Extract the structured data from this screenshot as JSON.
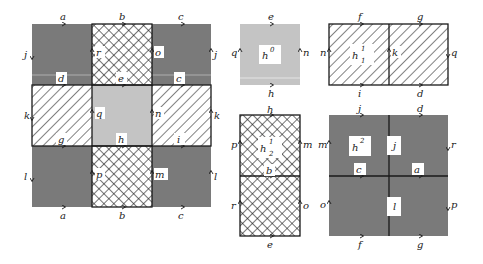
{
  "colors": {
    "dark_gray": "#7a7a7a",
    "light_gray": "#c4c4c4",
    "hatch_bg": "#ffffff",
    "stroke": "#1a1a1a",
    "label_box": "#ffffff"
  },
  "main_complex": {
    "top_edge_labels": [
      "a",
      "b",
      "c"
    ],
    "bottom_edge_labels": [
      "a",
      "b",
      "c"
    ],
    "row1_side_labels": {
      "left": "j",
      "inner_left": "r",
      "inner_right": "o",
      "right": "j"
    },
    "row1_bottom_labels": [
      "d",
      "e",
      "c"
    ],
    "row2_side_labels": {
      "left": "k",
      "inner_left": "q",
      "inner_right": "n",
      "right": "k"
    },
    "row2_bottom_labels": [
      "g",
      "h",
      "i"
    ],
    "row3_side_labels": {
      "left": "l",
      "inner_left": "p",
      "inner_right": "m",
      "right": "l"
    }
  },
  "cells": {
    "h0": {
      "name": "h",
      "sup": "0",
      "sub": "",
      "top": "e",
      "bottom": "h",
      "left": "q",
      "right": "n"
    },
    "h1_1": {
      "name": "h",
      "sup": "1",
      "sub": "1",
      "top": [
        "f",
        "g"
      ],
      "bottom": [
        "i",
        "d"
      ],
      "left": "n",
      "middle": "k",
      "right": "q"
    },
    "h1_2": {
      "name": "h",
      "sup": "1",
      "sub": "2",
      "top": "h",
      "middle": "b",
      "bottom": "e",
      "left": [
        "p",
        "r"
      ],
      "right": [
        "m",
        "o"
      ]
    },
    "h2": {
      "name": "h",
      "sup": "2",
      "sub": "",
      "top": [
        "j",
        "d"
      ],
      "bottom": [
        "f",
        "g"
      ],
      "left": [
        "m",
        "o"
      ],
      "right": [
        "r",
        "p"
      ],
      "center_horizontal": [
        "c",
        "a"
      ],
      "center_vertical": [
        "j",
        "l"
      ]
    }
  }
}
